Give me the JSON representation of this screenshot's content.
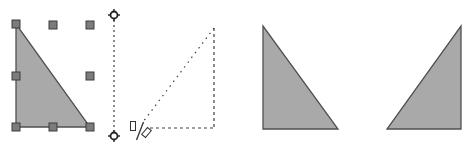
{
  "colors": {
    "fill": "#a9a9a9",
    "stroke": "#505050",
    "handle_fill": "#808080",
    "handle_stroke": "#404040",
    "guide": "#404040"
  },
  "panels": [
    {
      "id": "selected",
      "description": "Triangle selected with 8 resize handles"
    },
    {
      "id": "flipping",
      "description": "Dashed outline while flipping with mirror axis and flip cursor"
    },
    {
      "id": "original",
      "description": "Original triangle"
    },
    {
      "id": "flipped",
      "description": "Horizontally flipped triangle"
    }
  ],
  "icons": {
    "flip_cursor": "flip-cursor-icon",
    "axis_handle": "rotation-axis-handle-icon"
  }
}
